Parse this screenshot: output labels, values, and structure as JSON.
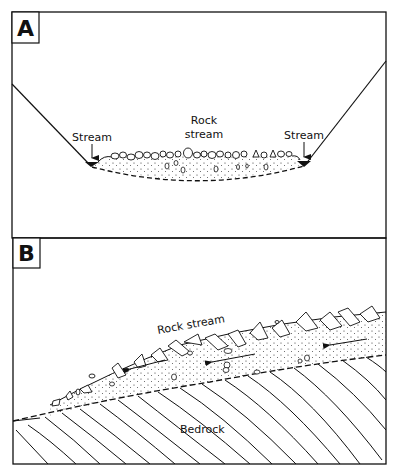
{
  "panels": [
    {
      "letter": "A",
      "labels": {
        "stream_left": "Stream",
        "rock_stream_line1": "Rock",
        "rock_stream_line2": "stream",
        "stream_right": "Stream"
      }
    },
    {
      "letter": "B",
      "labels": {
        "rock_stream": "Rock stream",
        "bedrock": "Bedrock"
      }
    }
  ],
  "colors": {
    "ink": "#111111",
    "background": "#ffffff"
  }
}
